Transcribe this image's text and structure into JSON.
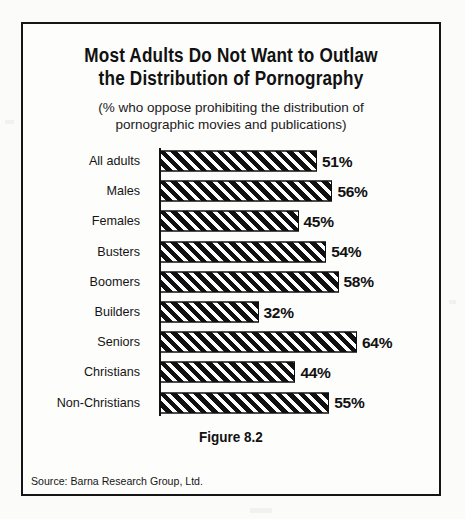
{
  "figure": {
    "title_lines": [
      "Most Adults Do Not Want to Outlaw",
      "the Distribution of Pornography"
    ],
    "subtitle_lines": [
      "(% who oppose prohibiting the distribution of",
      "pornographic movies and publications)"
    ],
    "caption": "Figure 8.2",
    "source": "Source: Barna Research Group, Ltd."
  },
  "chart_data": {
    "type": "bar",
    "orientation": "horizontal",
    "title": "Most Adults Do Not Want to Outlaw the Distribution of Pornography",
    "subtitle": "(% who oppose prohibiting the distribution of pornographic movies and publications)",
    "xlabel": "",
    "ylabel": "",
    "xlim": [
      0,
      64
    ],
    "grid": false,
    "legend": "none",
    "value_suffix": "%",
    "categories": [
      "All adults",
      "Males",
      "Females",
      "Busters",
      "Boomers",
      "Builders",
      "Seniors",
      "Christians",
      "Non-Christians"
    ],
    "values": [
      51,
      56,
      45,
      54,
      58,
      32,
      64,
      44,
      55
    ],
    "value_labels": [
      "51%",
      "56%",
      "45%",
      "54%",
      "58%",
      "32%",
      "64%",
      "44%",
      "55%"
    ],
    "bar_fill": "#111111",
    "bar_pattern": "diagonal-hatch-45",
    "bar_edge_color": "#0f0f0f"
  }
}
